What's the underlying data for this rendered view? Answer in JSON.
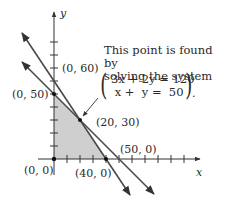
{
  "figure": {
    "axes": {
      "x_label": "x",
      "y_label": "y"
    },
    "points": [
      {
        "label": "(0, 60)"
      },
      {
        "label": "(0, 50)"
      },
      {
        "label": "(20, 30)"
      },
      {
        "label": "(50, 0)"
      },
      {
        "label": "(0, 0)"
      },
      {
        "label": "(40, 0)"
      }
    ],
    "annotation": {
      "line1": "This point is found by",
      "line2": "solving the system",
      "eq1": "3x + 2y = 120",
      "eq2": " x +  y =  50",
      "trailing": "."
    },
    "lines": [
      {
        "equation": "3x + 2y = 120",
        "x_intercept": 40,
        "y_intercept": 60
      },
      {
        "equation": "x + y = 50",
        "x_intercept": 50,
        "y_intercept": 50
      }
    ],
    "feasible_region_vertices": [
      "(0, 0)",
      "(0, 50)",
      "(20, 30)",
      "(40, 0)"
    ],
    "colors": {
      "line": "#4a4a4a",
      "shade": "#cfcfcf"
    }
  }
}
